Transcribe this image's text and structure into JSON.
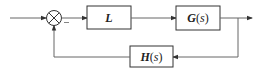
{
  "diagram": {
    "type": "feedback-control-block-diagram",
    "colors": {
      "line": "#555555",
      "stroke": "#333333",
      "background": "#ffffff"
    },
    "blocks": [
      {
        "id": "L",
        "label": "L"
      },
      {
        "id": "G",
        "label_main": "G",
        "label_open": "(",
        "label_var": "s",
        "label_close": ")"
      },
      {
        "id": "H",
        "label_main": "H",
        "label_open": "(",
        "label_var": "s",
        "label_close": ")"
      }
    ],
    "summing_junction": {
      "symbol": "⊗",
      "feedback_sign": "−"
    },
    "connections": [
      "input → summing junction",
      "summing junction → L",
      "L → G(s)",
      "G(s) → output",
      "output branch → H(s)",
      "H(s) → summing junction (negative)"
    ]
  }
}
